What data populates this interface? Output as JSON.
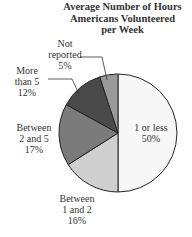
{
  "chart_data": {
    "type": "pie",
    "title": "Average Number of Hours Americans Volunteered per Week",
    "title_lines": [
      "Average Number of Hours",
      "Americans Volunteered",
      "per Week"
    ],
    "categories": [
      "1 or less",
      "Between 1 and 2",
      "Between 2 and 5",
      "More than 5",
      "Not reported"
    ],
    "values": [
      50,
      16,
      17,
      12,
      5
    ],
    "unit": "%",
    "colors": [
      "#f7f7f7",
      "#cfcfcf",
      "#7b7b7b",
      "#4a4a4a",
      "#9a9a9a"
    ],
    "labels": [
      {
        "lines": [
          "1 or less",
          "50%"
        ]
      },
      {
        "lines": [
          "Between",
          "1 and 2",
          "16%"
        ]
      },
      {
        "lines": [
          "Between",
          "2 and 5",
          "17%"
        ]
      },
      {
        "lines": [
          "More",
          "than 5",
          "12%"
        ]
      },
      {
        "lines": [
          "Not",
          "reported",
          "5%"
        ]
      }
    ],
    "legend": "none (direct labels)"
  }
}
